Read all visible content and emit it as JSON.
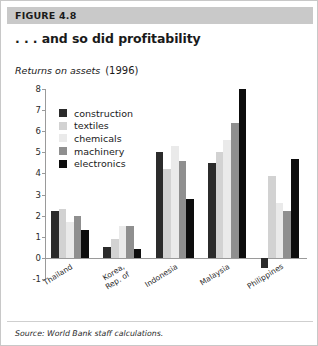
{
  "figure": {
    "header_label": "FIGURE 4.8",
    "title": ". . . and so did profitability",
    "subtitle": "Returns on assets",
    "subtitle_year": "(1996)",
    "source": "Source: World Bank staff calculations.",
    "header_bg": "#c9c9c9",
    "card_border": "#c8c8c8"
  },
  "chart_data": {
    "type": "bar",
    "title": ". . . and so did profitability",
    "subtitle": "Returns on assets  (1996)",
    "xlabel": "",
    "ylabel": "",
    "ylim": [
      -1,
      8
    ],
    "yticks": [
      -1,
      0,
      1,
      2,
      3,
      4,
      5,
      6,
      7,
      8
    ],
    "ytick_labels": [
      "-1",
      "0",
      "1",
      "2",
      "3",
      "4",
      "5",
      "6",
      "7",
      "8"
    ],
    "grid": false,
    "legend_position": "upper-left-inside",
    "categories": [
      "Thailand",
      "Korea, Rep. of",
      "Indonesia",
      "Malaysia",
      "Philippines"
    ],
    "category_label_lines": [
      [
        "Thailand"
      ],
      [
        "Korea,",
        "Rep. of"
      ],
      [
        "Indonesia"
      ],
      [
        "Malaysia"
      ],
      [
        "Philippines"
      ]
    ],
    "series": [
      {
        "name": "construction",
        "color": "#2b2b2b",
        "values": [
          2.2,
          0.5,
          5.0,
          4.5,
          -0.5
        ]
      },
      {
        "name": "textiles",
        "color": "#d2d2d2",
        "values": [
          2.3,
          0.9,
          4.2,
          5.0,
          3.9
        ]
      },
      {
        "name": "chemicals",
        "color": "#eaeaea",
        "values": [
          1.7,
          1.5,
          5.3,
          5.6,
          2.6
        ]
      },
      {
        "name": "machinery",
        "color": "#8f8f8f",
        "values": [
          2.0,
          1.5,
          4.6,
          6.4,
          2.2
        ]
      },
      {
        "name": "electronics",
        "color": "#0d0d0d",
        "values": [
          1.3,
          0.4,
          2.8,
          8.0,
          4.7
        ]
      }
    ]
  }
}
